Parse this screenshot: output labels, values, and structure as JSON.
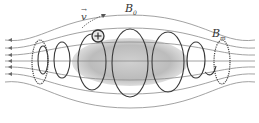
{
  "diagram": {
    "labels": {
      "velocity": {
        "symbol": "v",
        "vector": true
      },
      "field_center": {
        "base": "B",
        "sub": "0"
      },
      "field_max": {
        "base": "B",
        "sub": "m"
      }
    },
    "particle": {
      "charge_symbol": "+"
    },
    "components": [
      "magnetic field lines (converging at both ends)",
      "plasma region (gray ellipsoid)",
      "helical particle trajectory loops",
      "dashed mirror coil rings at ends"
    ],
    "colors": {
      "field_line": "#8a8a8a",
      "trajectory": "#3a3a3a",
      "plasma": "#b5b5b5",
      "background": "#ffffff"
    }
  }
}
